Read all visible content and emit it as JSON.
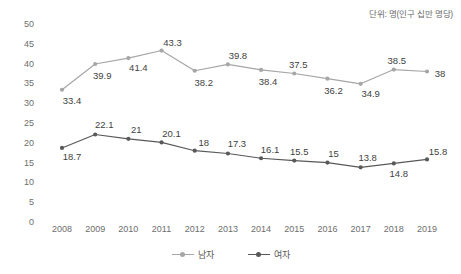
{
  "caption": {
    "unit_note": "단위: 명(인구 십만 명당)"
  },
  "legend": {
    "position": "bottom-center",
    "entries": [
      {
        "label": "남자",
        "color": "#A6A6A6"
      },
      {
        "label": "여자",
        "color": "#595959"
      }
    ]
  },
  "axes": {
    "y_ticks": [
      "50",
      "45",
      "40",
      "35",
      "30",
      "25",
      "20",
      "15",
      "10",
      "5",
      "0"
    ],
    "x_ticks": [
      "2008",
      "2009",
      "2010",
      "2011",
      "2012",
      "2013",
      "2014",
      "2015",
      "2016",
      "2017",
      "2018",
      "2019"
    ]
  },
  "chart_data": {
    "type": "line",
    "title": "",
    "subtitle": "",
    "xlabel": "",
    "ylabel": "",
    "unit_note": "단위: 명(인구 십만 명당)",
    "categories": [
      "2008",
      "2009",
      "2010",
      "2011",
      "2012",
      "2013",
      "2014",
      "2015",
      "2016",
      "2017",
      "2018",
      "2019"
    ],
    "series": [
      {
        "name": "남자",
        "color": "#A6A6A6",
        "values": [
          33.4,
          39.9,
          41.4,
          43.3,
          38.2,
          39.8,
          38.4,
          37.5,
          36.2,
          34.9,
          38.5,
          38
        ],
        "labels": [
          "33.4",
          "39.9",
          "41.4",
          "43.3",
          "38.2",
          "39.8",
          "38.4",
          "37.5",
          "36.2",
          "34.9",
          "38.5",
          "38"
        ]
      },
      {
        "name": "여자",
        "color": "#595959",
        "values": [
          18.7,
          22.1,
          21,
          20.1,
          18,
          17.3,
          16.1,
          15.5,
          15,
          13.8,
          14.8,
          15.8
        ],
        "labels": [
          "18.7",
          "22.1",
          "21",
          "20.1",
          "18",
          "17.3",
          "16.1",
          "15.5",
          "15",
          "13.8",
          "14.8",
          "15.8"
        ]
      }
    ],
    "ylim": [
      0,
      50
    ],
    "ytick_step": 5,
    "grid": false,
    "legend_position": "bottom-center",
    "marker": "circle"
  },
  "label_offsets": {
    "남자": [
      {
        "dx": 10,
        "dy": 10
      },
      {
        "dx": 7,
        "dy": 11
      },
      {
        "dx": 10,
        "dy": 9
      },
      {
        "dx": 11,
        "dy": -9
      },
      {
        "dx": 9,
        "dy": 11
      },
      {
        "dx": 10,
        "dy": -9
      },
      {
        "dx": 7,
        "dy": 11
      },
      {
        "dx": 4,
        "dy": -10
      },
      {
        "dx": 6,
        "dy": 11
      },
      {
        "dx": 10,
        "dy": 9
      },
      {
        "dx": 3,
        "dy": -10
      },
      {
        "dx": 13,
        "dy": 1
      }
    ],
    "여자": [
      {
        "dx": 10,
        "dy": 8
      },
      {
        "dx": 9,
        "dy": -10
      },
      {
        "dx": 8,
        "dy": -10
      },
      {
        "dx": 10,
        "dy": -9
      },
      {
        "dx": 9,
        "dy": -9
      },
      {
        "dx": 9,
        "dy": -10
      },
      {
        "dx": 9,
        "dy": -9
      },
      {
        "dx": 5,
        "dy": -10
      },
      {
        "dx": 6,
        "dy": -10
      },
      {
        "dx": 7,
        "dy": -10
      },
      {
        "dx": 5,
        "dy": 10
      },
      {
        "dx": 11,
        "dy": -8
      }
    ]
  }
}
